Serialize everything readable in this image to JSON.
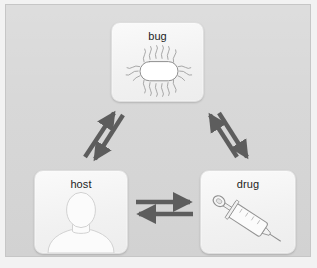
{
  "diagram": {
    "background_color": "#d7d7d7",
    "panel_border_color": "#c6c6c6",
    "arrow_color": "#5d5d5d",
    "card_color": "#f4f4f4",
    "label_color": "#1d1d1d",
    "nodes": [
      {
        "id": "bug",
        "label": "bug",
        "icon": "bacterium-icon",
        "position": "top-center"
      },
      {
        "id": "host",
        "label": "host",
        "icon": "person-silhouette-icon",
        "position": "bottom-left"
      },
      {
        "id": "drug",
        "label": "drug",
        "icon": "syringe-icon",
        "position": "bottom-right"
      }
    ],
    "edges": [
      {
        "id": "host-bug",
        "from": "host",
        "to": "bug",
        "style": "double-arrow",
        "direction": "bidirectional",
        "orientation": "diagonal-left"
      },
      {
        "id": "bug-drug",
        "from": "bug",
        "to": "drug",
        "style": "double-arrow",
        "direction": "bidirectional",
        "orientation": "diagonal-right"
      },
      {
        "id": "host-drug",
        "from": "host",
        "to": "drug",
        "style": "double-arrow",
        "direction": "bidirectional",
        "orientation": "horizontal"
      }
    ]
  }
}
